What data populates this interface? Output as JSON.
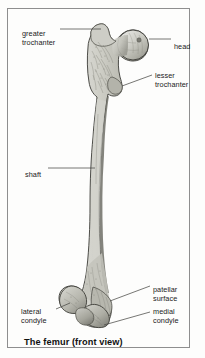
{
  "figure": {
    "caption": "The femur (front view)",
    "view": "front view",
    "subject": "femur",
    "style": {
      "frame_border_color": "#8e8e8e",
      "background_color": "#fdfdfc",
      "bone_fill_light": "#d8d8d0",
      "bone_fill_mid": "#bdbdb4",
      "bone_fill_dark": "#8e8e86",
      "outline_color": "#3a3a36",
      "leader_line_color": "#4a4a46",
      "text_color": "#1b1b1b"
    },
    "labels": [
      {
        "id": "greater-trochanter",
        "text": "greater\ntrochanter",
        "side": "left",
        "leader": {
          "x1": 52,
          "y1": 20,
          "x2": 93,
          "y2": 20
        }
      },
      {
        "id": "head",
        "text": "head",
        "side": "right",
        "leader": {
          "x1": 141,
          "y1": 30,
          "x2": 163,
          "y2": 30
        }
      },
      {
        "id": "lesser-trochanter",
        "text": "lesser\ntrochanter",
        "side": "right",
        "leader": {
          "x1": 118,
          "y1": 74,
          "x2": 144,
          "y2": 66
        }
      },
      {
        "id": "shaft",
        "text": "shaft",
        "side": "left",
        "leader": {
          "x1": 40,
          "y1": 159,
          "x2": 86,
          "y2": 159
        }
      },
      {
        "id": "patellar-surface",
        "text": "patellar\nsurface",
        "side": "right",
        "leader": {
          "x1": 118,
          "y1": 292,
          "x2": 142,
          "y2": 277
        }
      },
      {
        "id": "lateral-condyle",
        "text": "lateral\ncondyle",
        "side": "left",
        "leader": {
          "x1": 50,
          "y1": 303,
          "x2": 70,
          "y2": 303
        }
      },
      {
        "id": "medial-condyle",
        "text": "medial\ncondyle",
        "side": "right",
        "leader": {
          "x1": 110,
          "y1": 312,
          "x2": 142,
          "y2": 303
        }
      }
    ]
  }
}
